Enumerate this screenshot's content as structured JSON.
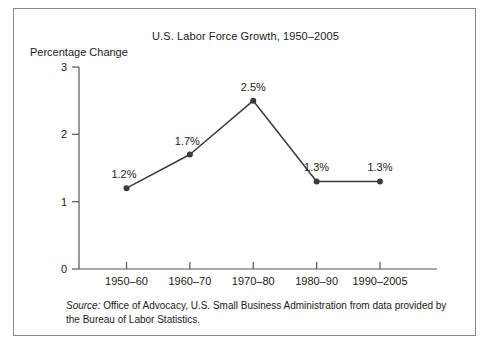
{
  "chart_data": {
    "type": "line",
    "title": "U.S. Labor Force Growth, 1950–2005",
    "xlabel": "",
    "ylabel": "Percentage Change",
    "categories": [
      "1950–60",
      "1960–70",
      "1970–80",
      "1980–90",
      "1990–2005"
    ],
    "values": [
      1.2,
      1.7,
      2.5,
      1.3,
      1.3
    ],
    "point_labels": [
      "1.2%",
      "1.7%",
      "2.5%",
      "1.3%",
      "1.3%"
    ],
    "ytick_labels": [
      "0",
      "1",
      "2",
      "3"
    ],
    "ytick_values": [
      0,
      1,
      2,
      3
    ],
    "ylim": [
      0,
      3
    ],
    "grid": false,
    "legend": false,
    "series": [
      {
        "name": "U.S. Labor Force Growth",
        "values": [
          1.2,
          1.7,
          2.5,
          1.3,
          1.3
        ]
      }
    ],
    "line_color": "#3b3b3b",
    "marker_color": "#3b3b3b",
    "axis_color": "#555555"
  },
  "source": {
    "label": "Source:",
    "text": " Office of Advocacy, U.S. Small Business Administration from data provided by the Bureau of Labor Statistics."
  },
  "frame": {
    "border_color": "#888888",
    "background": "#ffffff"
  }
}
